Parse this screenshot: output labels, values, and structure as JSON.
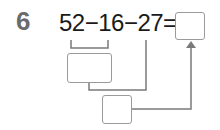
{
  "problem": {
    "number": "6",
    "expression": "52−16−27=",
    "terms": [
      "52",
      "16",
      "27"
    ],
    "operators": [
      "−",
      "−",
      "="
    ]
  },
  "boxes": {
    "answer": "",
    "step1": "",
    "step2": ""
  },
  "colors": {
    "number": "#6b6b6b",
    "text": "#1a1a1a",
    "box_border": "#9a9a9a",
    "line": "#7a7a7a"
  }
}
